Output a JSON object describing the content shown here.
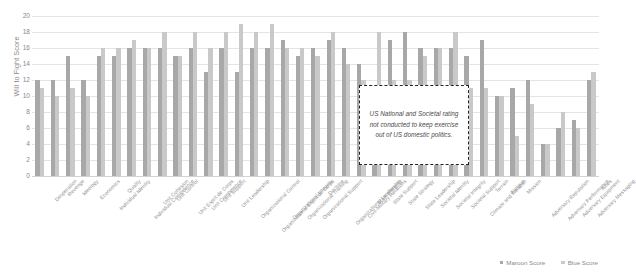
{
  "chart_data": {
    "type": "bar",
    "title": "",
    "xlabel": "",
    "ylabel": "Will to Fight Score",
    "ylim": [
      0,
      20
    ],
    "yticks": [
      0,
      2,
      4,
      6,
      8,
      10,
      12,
      14,
      16,
      18,
      20
    ],
    "grid": true,
    "legend_position": "bottom-right",
    "categories": [
      "Desperation",
      "Revenge",
      "Ideology",
      "Economics",
      "Individual Identity",
      "Quality",
      "Individual Competence",
      "Unit Cohesion",
      "Unit Control",
      "Unit Esprit de Corps",
      "Unit Competence",
      "Unit Support",
      "Unit Leadership",
      "Organizational Control",
      "Organizational Esprit de Corps",
      "Organizational Integrity",
      "Organizational Training",
      "Organizational Support",
      "Doctrine",
      "Organizational Leadership",
      "Civil-Military Relations",
      "State Integrity",
      "State Support",
      "State Strategy",
      "State Leadership",
      "Societal Identity",
      "Societal Integrity",
      "Societal Support",
      "Climate and Weather",
      "Terrain",
      "Fatigue",
      "Mission",
      "Adversary Reputation",
      "Adversary Performance",
      "Adversary Equipment",
      "Adversary Messaging",
      "Allies"
    ],
    "series": [
      {
        "name": "Maroon Score",
        "color": "#a8a8a8",
        "values": [
          12,
          12,
          15,
          12,
          15,
          15,
          16,
          16,
          16,
          15,
          16,
          13,
          16,
          13,
          16,
          16,
          17,
          15,
          16,
          17,
          16,
          14,
          11,
          17,
          18,
          16,
          16,
          16,
          15,
          17,
          10,
          11,
          12,
          4,
          6,
          7,
          12
        ]
      },
      {
        "name": "Blue Score",
        "color": "#c9c9c9",
        "values": [
          11,
          10,
          11,
          10,
          16,
          16,
          17,
          16,
          18,
          15,
          18,
          16,
          18,
          19,
          18,
          19,
          16,
          16,
          15,
          18,
          14,
          12,
          18,
          12,
          12,
          15,
          16,
          18,
          11,
          11,
          10,
          5,
          9,
          4,
          8,
          6,
          13
        ]
      }
    ],
    "annotation": {
      "text": "US National and Societal rating not conducted to keep exercise out of US domestic politics."
    }
  },
  "legend": {
    "items": [
      {
        "label": "Maroon Score"
      },
      {
        "label": "Blue Score"
      }
    ]
  }
}
